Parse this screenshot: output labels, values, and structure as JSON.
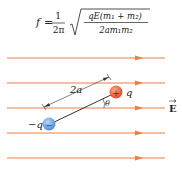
{
  "formula": {
    "lhs": "f",
    "eq": "=",
    "frac_num": "1",
    "frac_den": "2π",
    "sqrt_num": "qE(m₁ + m₂)",
    "sqrt_den": "2am₁m₂"
  },
  "diagram": {
    "field_label": "E",
    "positive_charge_label": "q",
    "negative_charge_label": "−q",
    "positive_sign": "+",
    "negative_sign": "−",
    "separation_label": "2a",
    "angle_label": "θ",
    "field_line_color": "#ef7d45",
    "positive_color": "#e8573a",
    "negative_color": "#5b9ee0"
  }
}
